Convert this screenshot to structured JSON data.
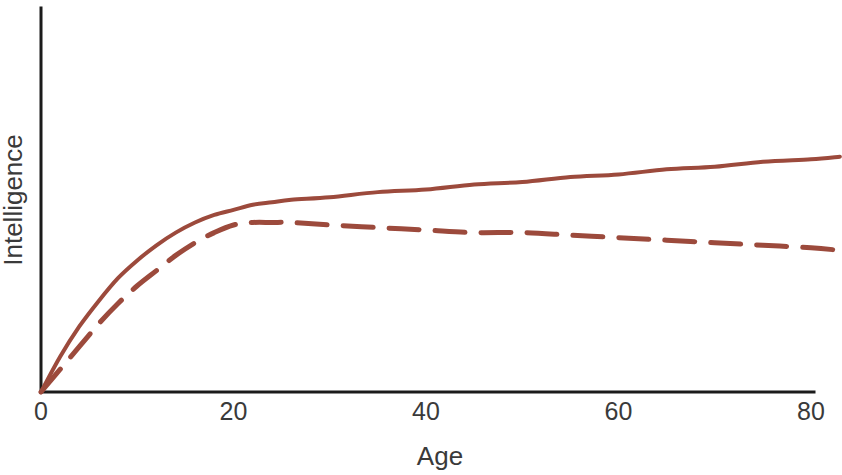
{
  "chart_data": {
    "type": "line",
    "title": "",
    "subtitle": "",
    "xlabel": "Age",
    "ylabel": "Intelligence",
    "xlim": [
      0,
      83
    ],
    "ylim": [
      0,
      100
    ],
    "grid": false,
    "legend_position": "none",
    "xticks": [
      0,
      20,
      40,
      60,
      80
    ],
    "xtick_labels": [
      "0",
      "20",
      "40",
      "60",
      "80"
    ],
    "yticks": [],
    "ytick_labels": [],
    "annotations": [],
    "colors": {
      "line": "#9C4A3C",
      "axis": "#1B1B1B",
      "text": "#3A3A3A",
      "background": "#FFFFFF"
    },
    "x": [
      0,
      2,
      4,
      6,
      8,
      10,
      12,
      14,
      16,
      18,
      20,
      22,
      24,
      26,
      30,
      35,
      40,
      45,
      50,
      55,
      60,
      65,
      70,
      75,
      80,
      83
    ],
    "series": [
      {
        "name": "Crystallized intelligence",
        "style": "solid",
        "color": "#9C4A3C",
        "values": [
          0,
          14,
          26,
          36,
          45,
          52,
          58,
          63,
          67,
          70,
          72,
          74,
          75,
          76,
          77,
          79,
          80,
          82,
          83,
          85,
          86,
          88,
          89,
          91,
          92,
          93
        ]
      },
      {
        "name": "Fluid intelligence",
        "style": "dashed",
        "color": "#9C4A3C",
        "values": [
          0,
          9,
          18,
          27,
          35,
          42,
          48,
          54,
          59,
          63,
          66,
          67,
          67,
          67,
          66,
          65,
          64,
          63,
          63,
          62,
          61,
          60,
          59,
          58,
          57,
          56
        ]
      }
    ]
  }
}
